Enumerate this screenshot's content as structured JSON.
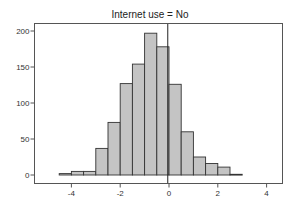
{
  "chart_data": {
    "type": "bar",
    "subtype": "histogram",
    "title": "Internet use = No",
    "xlabel": "",
    "ylabel": "",
    "bin_width": 0.5,
    "bin_edges": [
      -4.5,
      -4.0,
      -3.5,
      -3.0,
      -2.5,
      -2.0,
      -1.5,
      -1.0,
      -0.5,
      0.0,
      0.5,
      1.0,
      1.5,
      2.0,
      2.5,
      3.0
    ],
    "categories": [
      "-4.5 to -4.0",
      "-4.0 to -3.5",
      "-3.5 to -3.0",
      "-3.0 to -2.5",
      "-2.5 to -2.0",
      "-2.0 to -1.5",
      "-1.5 to -1.0",
      "-1.0 to -0.5",
      "-0.5 to 0.0",
      "0.0 to 0.5",
      "0.5 to 1.0",
      "1.0 to 1.5",
      "1.5 to 2.0",
      "2.0 to 2.5",
      "2.5 to 3.0"
    ],
    "values": [
      2,
      5,
      5,
      37,
      73,
      127,
      154,
      197,
      178,
      126,
      60,
      25,
      16,
      11,
      1
    ],
    "xlim": [
      -5.2,
      4.6
    ],
    "ylim": [
      -10,
      210
    ],
    "x_ticks": [
      -4,
      -2,
      0,
      2,
      4
    ],
    "x_tick_labels": [
      "-4",
      "-2",
      "0",
      "2",
      "4"
    ],
    "y_ticks": [
      0,
      50,
      100,
      150,
      200
    ],
    "y_tick_labels": [
      "0",
      "50",
      "100",
      "150",
      "200"
    ],
    "reference_line_x": -0.05,
    "grid": false,
    "legend": null,
    "colors": {
      "bar_fill": "#c4c4c4",
      "bar_edge": "#333333",
      "frame": "#555555"
    }
  }
}
